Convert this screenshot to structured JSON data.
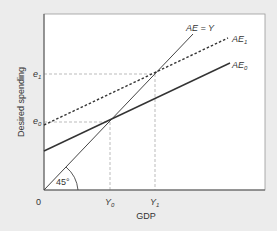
{
  "figure": {
    "ylabel": "Desired spending",
    "xlabel": "GDP",
    "origin": "0",
    "angle_label": "45°",
    "lines": {
      "ae_y": "AE = Y",
      "ae1_base": "AE",
      "ae1_sub": "1",
      "ae0_base": "AE",
      "ae0_sub": "0"
    },
    "y_ticks": {
      "e1_base": "e",
      "e1_sub": "1",
      "e0_base": "e",
      "e0_sub": "0"
    },
    "x_ticks": {
      "y0_base": "Y",
      "y0_sub": "0",
      "y1_base": "Y",
      "y1_sub": "1"
    },
    "colors": {
      "background": "#ececec",
      "plot_bg": "#ffffff",
      "line": "#333333",
      "guide": "#aaaaaa"
    }
  }
}
